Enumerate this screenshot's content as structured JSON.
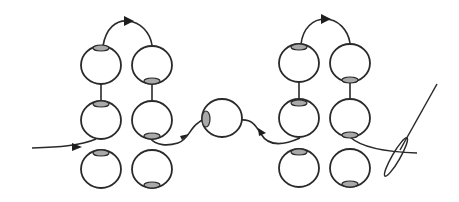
{
  "diagram": {
    "type": "beading-thread-path",
    "colors": {
      "background": "#ffffff",
      "outline": "#2a2a2a",
      "hole_fill": "#a9a9a9"
    },
    "groups": [
      {
        "name": "left-ladder",
        "beads": [
          {
            "id": "L-c1-r1",
            "cx": 101,
            "cy": 65,
            "hole": "top"
          },
          {
            "id": "L-c2-r1",
            "cx": 152,
            "cy": 65,
            "hole": "bottom"
          },
          {
            "id": "L-c1-r2",
            "cx": 101,
            "cy": 120,
            "hole": "top"
          },
          {
            "id": "L-c2-r2",
            "cx": 152,
            "cy": 120,
            "hole": "bottom"
          },
          {
            "id": "L-c1-r3",
            "cx": 101,
            "cy": 169,
            "hole": "top"
          },
          {
            "id": "L-c2-r3",
            "cx": 152,
            "cy": 169,
            "hole": "bottom"
          }
        ]
      },
      {
        "name": "connector-bead",
        "beads": [
          {
            "id": "M",
            "cx": 222,
            "cy": 118,
            "hole": "left"
          }
        ]
      },
      {
        "name": "right-ladder",
        "beads": [
          {
            "id": "R-c1-r1",
            "cx": 299,
            "cy": 63,
            "hole": "top"
          },
          {
            "id": "R-c2-r1",
            "cx": 350,
            "cy": 63,
            "hole": "bottom"
          },
          {
            "id": "R-c1-r2",
            "cx": 299,
            "cy": 118,
            "hole": "top"
          },
          {
            "id": "R-c2-r2",
            "cx": 350,
            "cy": 118,
            "hole": "bottom"
          },
          {
            "id": "R-c1-r3",
            "cx": 299,
            "cy": 168,
            "hole": "top"
          },
          {
            "id": "R-c2-r3",
            "cx": 350,
            "cy": 168,
            "hole": "bottom"
          }
        ]
      }
    ],
    "thread_path": [
      "entry-left",
      "L-c1-r2",
      "L-c1-r1",
      "arc-over",
      "L-c2-r1",
      "L-c2-r2",
      "M",
      "R-c1-r2",
      "R-c1-r1",
      "arc-over",
      "R-c2-r1",
      "R-c2-r2",
      "needle-exit-right"
    ],
    "icons": [
      "arrow-icon",
      "needle-icon"
    ]
  }
}
